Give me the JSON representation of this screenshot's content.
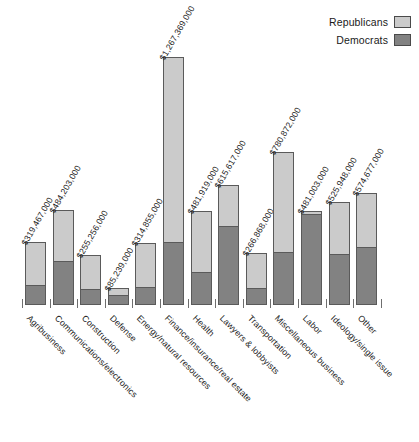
{
  "chart_data": {
    "type": "bar",
    "subtype": "stacked-vertical",
    "title": "",
    "subtitle": "",
    "xlabel": "",
    "ylabel": "",
    "grid": false,
    "legend_position": "top-right",
    "ylim": [
      0,
      1267369000
    ],
    "categories": [
      "Agribusiness",
      "Communications/electronics",
      "Construction",
      "Defense",
      "Energy/natural resources",
      "Finance/insurance/real estate",
      "Health",
      "Lawyers & lobbyists",
      "Transportation",
      "Miscellaneous business",
      "Labor",
      "Ideology/single issue",
      "Other"
    ],
    "series": [
      {
        "name": "Republicans",
        "color": "#cbcbcb",
        "values": [
          220432000,
          266312000,
          178679000,
          38354000,
          228770000,
          950527000,
          318066000,
          215466000,
          186808000,
          515376000,
          19240000,
          268234000,
          281592000
        ]
      },
      {
        "name": "Democrats",
        "color": "#828282",
        "values": [
          99035000,
          217891000,
          76577000,
          46885000,
          86085000,
          316842000,
          163853000,
          400151000,
          80060000,
          265496000,
          461763000,
          257714000,
          293085000
        ]
      }
    ],
    "totals": [
      319467000,
      484203000,
      255256000,
      85239000,
      314855000,
      1267369000,
      481919000,
      615617000,
      266868000,
      780872000,
      481003000,
      525948000,
      574677000
    ],
    "total_labels": [
      "$319,467,000",
      "$484,203,000",
      "$255,256,000",
      "$85,239,000",
      "$314,855,000",
      "$1,267,369,000",
      "$481,919,000",
      "$615,617,000",
      "$266,868,000",
      "$780,872,000",
      "$481,003,000",
      "$525,948,000",
      "$574,677,000"
    ],
    "dem_fraction": [
      0.31,
      0.45,
      0.3,
      0.55,
      0.273,
      0.25,
      0.34,
      0.65,
      0.3,
      0.34,
      0.96,
      0.49,
      0.51
    ]
  },
  "legend": {
    "items": [
      {
        "label": "Republicans",
        "color": "#cbcbcb"
      },
      {
        "label": "Democrats",
        "color": "#828282"
      }
    ]
  }
}
